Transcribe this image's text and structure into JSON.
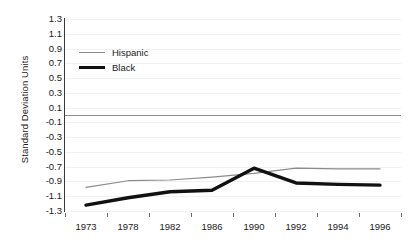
{
  "chart_data": {
    "type": "line",
    "title": "",
    "xlabel": "",
    "ylabel": "Standard Deviation Units",
    "categories": [
      "1973",
      "1978",
      "1982",
      "1986",
      "1990",
      "1992",
      "1994",
      "1996"
    ],
    "ylim": [
      -1.3,
      1.3
    ],
    "ytick_step": 0.2,
    "yticks": [
      "1.3",
      "1.1",
      "0.9",
      "0.7",
      "0.5",
      "0.3",
      "0.1",
      "-0.1",
      "-0.3",
      "-0.5",
      "-0.7",
      "-0.9",
      "-1.1",
      "-1.3"
    ],
    "ytick_values": [
      1.3,
      1.1,
      0.9,
      0.7,
      0.5,
      0.3,
      0.1,
      -0.1,
      -0.3,
      -0.5,
      -0.7,
      -0.9,
      -1.1,
      -1.3
    ],
    "grid": true,
    "zero_reference_line": 0.0,
    "legend_position": "top-left",
    "series": [
      {
        "name": "Hispanic",
        "color": "#8c8c8c",
        "width": 1.2,
        "values": [
          -0.98,
          -0.89,
          -0.88,
          -0.84,
          -0.79,
          -0.72,
          -0.73,
          -0.73
        ]
      },
      {
        "name": "Black",
        "color": "#111111",
        "width": 3.4,
        "values": [
          -1.22,
          -1.12,
          -1.04,
          -1.02,
          -0.72,
          -0.92,
          -0.94,
          -0.95
        ]
      }
    ]
  }
}
